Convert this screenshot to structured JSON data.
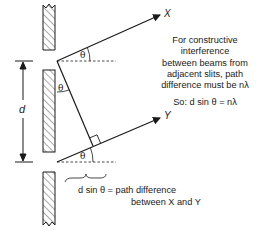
{
  "diagram": {
    "labels": {
      "ray_upper": "X",
      "ray_lower": "Y",
      "slit_spacing": "d",
      "angle": "θ"
    },
    "note": {
      "line1": "For constructive",
      "line2": "interference",
      "line3": "between beams from",
      "line4": "adjacent slits, path",
      "line5": "difference must be nλ",
      "equation": "So: d sin θ = nλ"
    },
    "caption": {
      "line1": "d sin θ = path difference",
      "line2": "between X and Y"
    },
    "colors": {
      "line": "#1a1a1a",
      "background": "#ffffff"
    }
  }
}
